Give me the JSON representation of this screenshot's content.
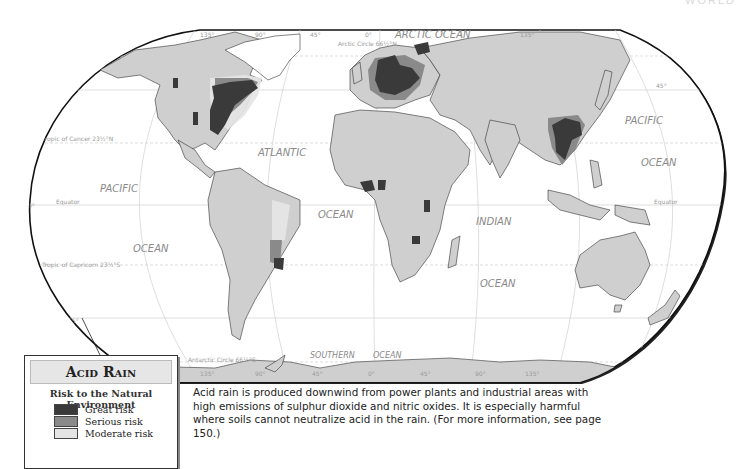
{
  "page": {
    "header_partial": "WORLD"
  },
  "map": {
    "title": "Acid Rain",
    "colors": {
      "land": "#cfcfcf",
      "ocean": "#ffffff",
      "great": "#3a3a3a",
      "serious": "#8a8a8a",
      "moderate": "#e4e4e4",
      "grid": "#cccccc",
      "border": "#222222"
    },
    "ocean_labels": {
      "arctic": "ARCTIC OCEAN",
      "atlantic": "ATLANTIC",
      "atlantic_ocean": "OCEAN",
      "pacific_west": "PACIFIC",
      "pacific_west_ocean": "OCEAN",
      "pacific_east": "PACIFIC",
      "pacific_east_ocean": "OCEAN",
      "indian": "INDIAN",
      "indian_ocean": "OCEAN",
      "southern": "SOUTHERN",
      "southern_ocean": "OCEAN"
    },
    "lines": {
      "arctic_circle": "Arctic Circle 66½°N",
      "tropic_cancer": "Tropic of Cancer 23½°N",
      "equator_west": "Equator",
      "equator_east": "Equator",
      "tropic_capricorn": "Tropic of Capricorn 23½°S",
      "antarctic_circle": "Antarctic Circle 66½°S"
    },
    "lat_labels": {
      "n45_west": "45°",
      "n45_east": "45°",
      "eq_west": "0°",
      "eq_east": "0°",
      "s45_west": "45°"
    },
    "lon_labels_top": [
      "135°",
      "90°",
      "45°",
      "0°",
      "135°"
    ],
    "lon_labels_bottom": [
      "135°",
      "90°",
      "45°",
      "0°",
      "45°",
      "90°",
      "135°"
    ]
  },
  "legend": {
    "title": "Acid Rain",
    "subtitle": "Risk to the Natural Environment",
    "items": [
      {
        "label": "Great risk",
        "color": "#3a3a3a"
      },
      {
        "label": "Serious risk",
        "color": "#8a8a8a"
      },
      {
        "label": "Moderate risk",
        "color": "#e4e4e4"
      }
    ]
  },
  "caption": "Acid rain is produced downwind from power plants and industrial areas with high emissions of sulphur dioxide and nitric oxides. It is especially harmful where soils cannot neutralize acid in the rain. (For more information, see page 150.)"
}
